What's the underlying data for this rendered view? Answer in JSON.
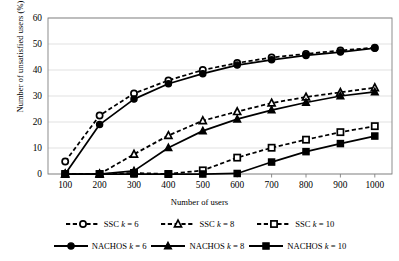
{
  "chart_data": {
    "type": "line",
    "title": "",
    "xlabel": "Number of users",
    "ylabel": "Number of unsatisfied users (%)",
    "x": [
      100,
      200,
      300,
      400,
      500,
      600,
      700,
      800,
      900,
      1000
    ],
    "xtick_labels": [
      "100",
      "200",
      "300",
      "400",
      "500",
      "600",
      "700",
      "800",
      "900",
      "1000"
    ],
    "ytick_labels": [
      "0",
      "10",
      "20",
      "30",
      "40",
      "50",
      "60"
    ],
    "yticks": [
      0,
      10,
      20,
      30,
      40,
      50,
      60
    ],
    "ylim": [
      0,
      60
    ],
    "grid": "horizontal",
    "legend_position": "bottom",
    "series": [
      {
        "name": "SSC k = 6",
        "marker": "circle-open",
        "line": "dashed",
        "values": [
          4.8,
          22.5,
          31.0,
          36.0,
          40.0,
          42.7,
          44.8,
          46.2,
          47.5,
          48.6
        ]
      },
      {
        "name": "SSC k = 8",
        "marker": "triangle-open",
        "line": "dashed",
        "values": [
          0,
          0,
          7.6,
          14.8,
          20.5,
          24.0,
          27.3,
          29.6,
          31.4,
          33.2
        ]
      },
      {
        "name": "SSC k = 10",
        "marker": "square-open",
        "line": "dashed",
        "values": [
          0,
          0,
          0.4,
          0,
          1.4,
          6.3,
          10.1,
          13.2,
          16.1,
          18.4
        ]
      },
      {
        "name": "NACHOS k = 6",
        "marker": "circle-filled",
        "line": "solid",
        "values": [
          0,
          19.0,
          28.8,
          34.7,
          38.6,
          41.9,
          43.9,
          45.6,
          46.9,
          48.4
        ]
      },
      {
        "name": "NACHOS k = 8",
        "marker": "triangle-filled",
        "line": "solid",
        "values": [
          0,
          0,
          1.2,
          10.1,
          16.6,
          21.1,
          24.6,
          27.5,
          30.0,
          31.6
        ]
      },
      {
        "name": "NACHOS k = 10",
        "marker": "square-filled",
        "line": "solid",
        "values": [
          0,
          0,
          0,
          0,
          0,
          0.2,
          4.6,
          8.6,
          11.7,
          14.6
        ]
      }
    ]
  },
  "legend": {
    "rows": [
      [
        {
          "label_prefix": "SSC ",
          "kvar": "k",
          "label_suffix": " = 6",
          "full": "SSC k = 6",
          "marker": "circle-open",
          "line": "dashed"
        },
        {
          "label_prefix": "SSC ",
          "kvar": "k",
          "label_suffix": " = 8",
          "full": "SSC k = 8",
          "marker": "triangle-open",
          "line": "dashed"
        },
        {
          "label_prefix": "SSC ",
          "kvar": "k",
          "label_suffix": " = 10",
          "full": "SSC k = 10",
          "marker": "square-open",
          "line": "dashed"
        }
      ],
      [
        {
          "label_prefix": "NACHOS ",
          "kvar": "k",
          "label_suffix": " = 6",
          "full": "NACHOS k = 6",
          "marker": "circle-filled",
          "line": "solid"
        },
        {
          "label_prefix": "NACHOS ",
          "kvar": "k",
          "label_suffix": " = 8",
          "full": "NACHOS k = 8",
          "marker": "triangle-filled",
          "line": "solid"
        },
        {
          "label_prefix": "NACHOS ",
          "kvar": "k",
          "label_suffix": " = 10",
          "full": "NACHOS k = 10",
          "marker": "square-filled",
          "line": "solid"
        }
      ]
    ]
  },
  "colors": {
    "series": "#000000",
    "grid": "#d9d9d9",
    "axis": "#808080",
    "background": "#ffffff"
  }
}
